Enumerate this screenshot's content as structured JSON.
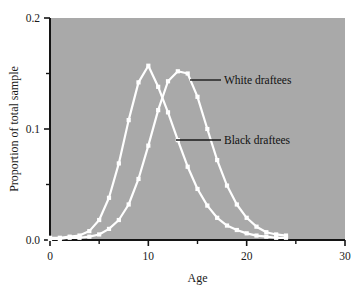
{
  "chart_data": {
    "type": "line",
    "title": "",
    "xlabel": "Age",
    "ylabel": "Proportion of total sample",
    "xlim": [
      0,
      30
    ],
    "ylim": [
      0.0,
      0.2
    ],
    "grid": false,
    "legend_position": "inline-annotation",
    "x_ticks_major": [
      0,
      10,
      20,
      30
    ],
    "x_tick_labels": [
      "0",
      "10",
      "20",
      "30"
    ],
    "x_ticks_minor": [
      5,
      15,
      25
    ],
    "y_ticks_major": [
      0.0,
      0.1,
      0.2
    ],
    "y_tick_labels": [
      "0.0",
      "0.1",
      "0.2"
    ],
    "y_ticks_minor": [
      0.05,
      0.15
    ],
    "plot_background": "#a9a9a9",
    "series_color": "#ffffff",
    "series": [
      {
        "name": "White draftees",
        "x": [
          0,
          1,
          2,
          3,
          4,
          5,
          6,
          7,
          8,
          9,
          10,
          11,
          12,
          13,
          14,
          15,
          16,
          17,
          18,
          19,
          20,
          21,
          22,
          23,
          24
        ],
        "values": [
          0.002,
          0.002,
          0.003,
          0.004,
          0.008,
          0.018,
          0.038,
          0.069,
          0.108,
          0.142,
          0.157,
          0.138,
          0.115,
          0.09,
          0.066,
          0.046,
          0.031,
          0.02,
          0.013,
          0.009,
          0.006,
          0.004,
          0.003,
          0.002,
          0.002
        ]
      },
      {
        "name": "Black draftees",
        "x": [
          0,
          1,
          2,
          3,
          4,
          5,
          6,
          7,
          8,
          9,
          10,
          11,
          12,
          13,
          14,
          15,
          16,
          17,
          18,
          19,
          20,
          21,
          22,
          23,
          24
        ],
        "values": [
          0.001,
          0.001,
          0.002,
          0.002,
          0.003,
          0.005,
          0.01,
          0.018,
          0.032,
          0.055,
          0.085,
          0.117,
          0.143,
          0.152,
          0.15,
          0.129,
          0.1,
          0.072,
          0.049,
          0.032,
          0.02,
          0.012,
          0.007,
          0.005,
          0.004
        ]
      }
    ],
    "annotations": [
      {
        "text": "White draftees",
        "series": "White draftees",
        "text_x_px": 224,
        "text_y_px": 84,
        "leader_from_px": [
          190,
          80
        ],
        "leader_to_px": [
          221,
          80
        ]
      },
      {
        "text": "Black draftees",
        "series": "Black draftees",
        "text_x_px": 224,
        "text_y_px": 144,
        "leader_from_px": [
          176,
          140
        ],
        "leader_to_px": [
          221,
          140
        ]
      }
    ]
  }
}
